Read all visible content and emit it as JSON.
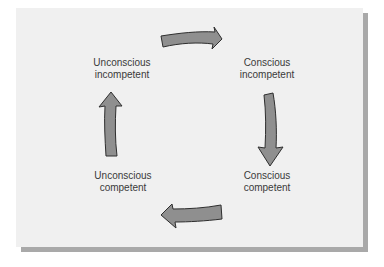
{
  "diagram": {
    "title": "",
    "type": "cycle",
    "nodes": [
      {
        "id": "top-left",
        "line1": "Unconscious",
        "line2": "incompetent"
      },
      {
        "id": "top-right",
        "line1": "Conscious",
        "line2": "incompetent"
      },
      {
        "id": "bottom-right",
        "line1": "Conscious",
        "line2": "competent"
      },
      {
        "id": "bottom-left",
        "line1": "Unconscious",
        "line2": "competent"
      }
    ],
    "edges": [
      {
        "from": "Unconscious incompetent",
        "to": "Conscious incompetent",
        "direction": "right"
      },
      {
        "from": "Conscious incompetent",
        "to": "Conscious competent",
        "direction": "down"
      },
      {
        "from": "Conscious competent",
        "to": "Unconscious competent",
        "direction": "left"
      },
      {
        "from": "Unconscious competent",
        "to": "Unconscious incompetent",
        "direction": "up"
      }
    ],
    "colors": {
      "panel_bg": "#f0f0f0",
      "shadow": "#a9a9a9",
      "arrow_fill": "#8f8f8f",
      "arrow_stroke": "#2e2e2e",
      "text": "#3a3a3a"
    }
  }
}
